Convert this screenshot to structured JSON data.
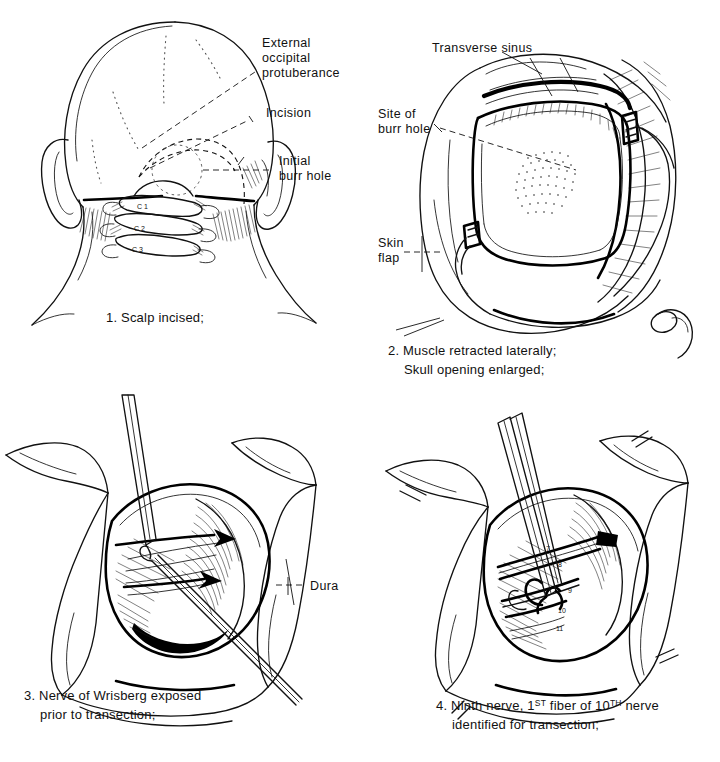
{
  "document": {
    "type": "surgical-procedure-illustration",
    "title": "Retromastoid approach — operative steps",
    "background_color": "#ffffff",
    "ink_color": "#111111",
    "panel_count": 4
  },
  "panels": [
    {
      "id": "panel-1",
      "number": "1.",
      "caption": "1. Scalp incised;",
      "view": "posterior view of head and neck",
      "labels": [
        {
          "id": "external-occipital-protuberance",
          "lines": [
            "External",
            "occipital",
            "protuberance"
          ],
          "text": "External occipital protuberance"
        },
        {
          "id": "incision",
          "lines": [
            "Incision"
          ],
          "text": "Incision"
        },
        {
          "id": "initial-burr-hole",
          "lines": [
            "Initial",
            "burr hole"
          ],
          "text": "Initial burr hole"
        }
      ],
      "vertebrae": [
        "C 1",
        "C 2",
        "C 3"
      ]
    },
    {
      "id": "panel-2",
      "number": "2.",
      "caption_lines": [
        "2. Muscle retracted laterally;",
        "Skull opening enlarged;"
      ],
      "caption": "2. Muscle retracted laterally; Skull opening enlarged;",
      "view": "enlarged craniectomy with retractors",
      "labels": [
        {
          "id": "transverse-sinus",
          "lines": [
            "Transverse sinus"
          ],
          "text": "Transverse sinus"
        },
        {
          "id": "site-of-burr-hole",
          "lines": [
            "Site of",
            "burr hole"
          ],
          "text": "Site of burr hole"
        },
        {
          "id": "skin-flap",
          "lines": [
            "Skin",
            "flap"
          ],
          "text": "Skin flap"
        }
      ]
    },
    {
      "id": "panel-3",
      "number": "3.",
      "caption_lines": [
        "3. Nerve of Wrisberg exposed",
        "prior to transection;"
      ],
      "caption": "3. Nerve of Wrisberg exposed prior to transection;",
      "view": "cerebellopontine angle exposure",
      "labels": [
        {
          "id": "dura",
          "lines": [
            "Dura"
          ],
          "text": "Dura"
        }
      ]
    },
    {
      "id": "panel-4",
      "number": "4.",
      "caption_lines": [
        "4. Ninth nerve, 1ST fiber of 10TH nerve",
        "identified for transection;"
      ],
      "caption": "4. Ninth nerve, 1ST fiber of 10TH nerve identified for transection;",
      "caption_parts": {
        "lead": "4. Ninth nerve, 1",
        "sup1": "ST",
        "mid": " fiber of 10",
        "sup2": "TH",
        "tail": " nerve",
        "line2": "identified for transection;"
      },
      "view": "cranial nerves identified in surgical field",
      "nerve_numbers": [
        "7",
        "8",
        "9",
        "10",
        "11"
      ]
    }
  ]
}
